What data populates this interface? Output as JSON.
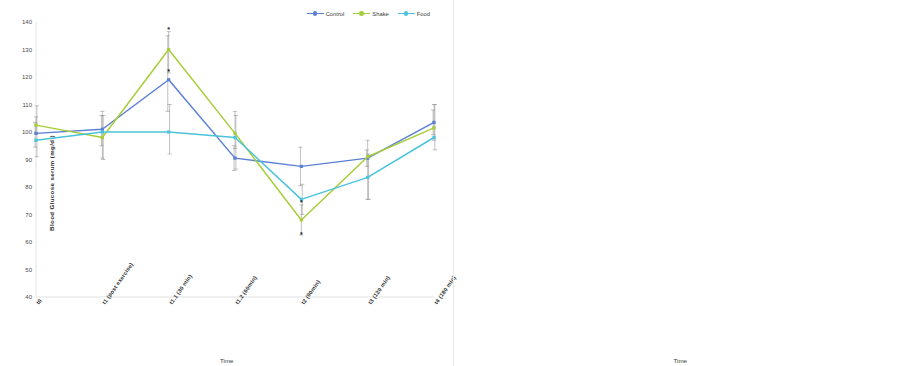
{
  "figure": {
    "panels": [
      "glucose",
      "insulin"
    ],
    "significance_marker": "*"
  },
  "legend": {
    "items": [
      {
        "label": "Control",
        "color": "#5B7FD4"
      },
      {
        "label": "Shake",
        "color": "#A7CE3A"
      },
      {
        "label": "Food",
        "color": "#4BC3DB"
      }
    ]
  },
  "chart_data": [
    {
      "type": "line",
      "id": "glucose",
      "title": "",
      "xlabel": "Time",
      "ylabel": "Blood Glucose serum  (mg/dl)",
      "ylim": [
        40,
        140
      ],
      "yticks": [
        40,
        50,
        60,
        70,
        80,
        90,
        100,
        110,
        120,
        130,
        140
      ],
      "grid": false,
      "legend_position": "top-right",
      "categories": [
        "t0",
        "t1 (post exercise)",
        "t1.1 (30 min)",
        "t1.2 (60min)",
        "t2 (90min)",
        "t3 (120 min)",
        "t4 (180 min)"
      ],
      "series": [
        {
          "name": "Control",
          "color": "#5B7FD4",
          "values": [
            99.5,
            101.0,
            119.0,
            90.5,
            87.5,
            90.5,
            103.5
          ],
          "err_low": [
            94.5,
            95.0,
            107.5,
            86.0,
            80.5,
            87.5,
            99.0
          ],
          "err_high": [
            103.5,
            106.0,
            135.0,
            95.0,
            94.5,
            93.5,
            108.0
          ]
        },
        {
          "name": "Shake",
          "color": "#A7CE3A",
          "values": [
            102.5,
            98.0,
            130.0,
            99.5,
            68.0,
            91.0,
            101.5
          ],
          "err_low": [
            99.5,
            90.5,
            121.5,
            94.0,
            62.5,
            75.5,
            97.0
          ],
          "err_high": [
            105.5,
            107.5,
            136.5,
            107.5,
            73.5,
            97.0,
            110.0
          ]
        },
        {
          "name": "Food",
          "color": "#4BC3DB",
          "values": [
            97.0,
            100.0,
            100.0,
            98.0,
            75.5,
            83.5,
            98.0
          ],
          "err_low": [
            91.0,
            90.0,
            92.0,
            86.5,
            70.0,
            75.5,
            93.5
          ],
          "err_high": [
            109.5,
            106.0,
            110.0,
            106.0,
            81.0,
            92.0,
            110.0
          ]
        }
      ],
      "significance": [
        {
          "category_index": 2,
          "series": "Shake",
          "value": 136.5
        },
        {
          "category_index": 2,
          "series": "Control",
          "value": 121.0
        },
        {
          "category_index": 4,
          "series": "Food",
          "value": 73.5
        },
        {
          "category_index": 4,
          "series": "Shake",
          "value": 62.0
        }
      ]
    },
    {
      "type": "line",
      "id": "insulin",
      "title": "",
      "xlabel": "Time",
      "ylabel": "Insulin serum (ug/ml)",
      "ylim": [
        0,
        90
      ],
      "yticks": [
        0,
        10,
        20,
        30,
        40,
        50,
        60,
        70,
        80,
        90
      ],
      "grid": false,
      "legend_position": "top-right",
      "categories": [
        "t0",
        "t1 (post exercise)",
        "t1.1 (30 min)",
        "t1.2 (60min)",
        "t2 (90min)",
        "t3 (120 min)",
        "t4 (180 min)"
      ],
      "series": [
        {
          "name": "Control",
          "color": "#5B7FD4",
          "values": [
            5.2,
            5.0,
            5.3,
            4.2,
            6.3,
            5.2,
            4.2
          ],
          "err_low": [
            4.0,
            3.7,
            3.8,
            2.8,
            4.0,
            3.7,
            1.8
          ],
          "err_high": [
            6.6,
            6.3,
            6.5,
            5.6,
            8.5,
            6.8,
            6.8
          ]
        },
        {
          "name": "Shake",
          "color": "#A7CE3A",
          "values": [
            5.8,
            5.8,
            58.5,
            75.0,
            40.5,
            10.5,
            4.8
          ],
          "err_low": [
            4.6,
            4.6,
            54.0,
            72.0,
            36.5,
            8.8,
            3.6
          ],
          "err_high": [
            7.0,
            7.2,
            62.5,
            78.0,
            44.0,
            12.5,
            6.0
          ]
        },
        {
          "name": "Food",
          "color": "#4BC3DB",
          "values": [
            5.4,
            5.3,
            19.8,
            25.0,
            19.8,
            8.5,
            4.5
          ],
          "err_low": [
            4.2,
            4.2,
            16.8,
            22.5,
            16.5,
            6.8,
            3.2
          ],
          "err_high": [
            6.8,
            6.6,
            22.8,
            27.5,
            22.5,
            10.2,
            5.8
          ]
        }
      ],
      "significance": [
        {
          "category_index": 2,
          "series": "Shake",
          "value": 64.0
        },
        {
          "category_index": 3,
          "series": "Shake",
          "value": 80.5
        },
        {
          "category_index": 4,
          "series": "Shake",
          "value": 46.0
        },
        {
          "category_index": 2,
          "series": "Food",
          "value": 25.0
        },
        {
          "category_index": 3,
          "series": "Food",
          "value": 29.0
        },
        {
          "category_index": 4,
          "series": "Food",
          "value": 25.0
        }
      ]
    }
  ]
}
